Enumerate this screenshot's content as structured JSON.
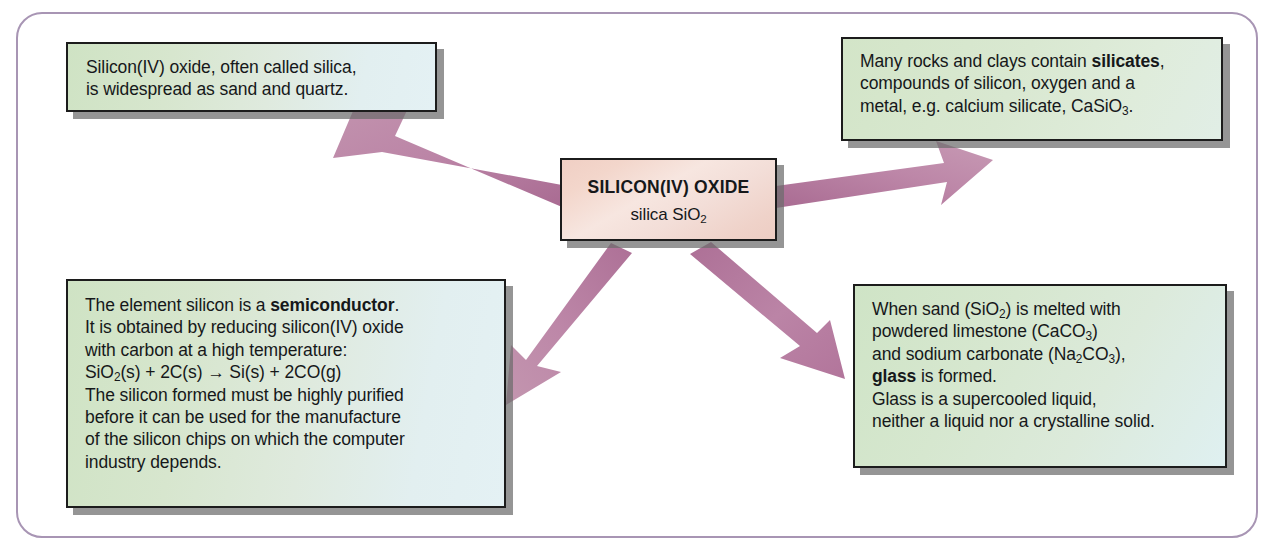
{
  "diagram": {
    "frame_border_color": "#a895b4",
    "arrow_color": "#b5799f",
    "box_border_color": "#1c1c1c",
    "box_shadow_color": "#6c6c6c"
  },
  "center": {
    "title": "SILICON(IV) OXIDE",
    "subtitle_prefix": "silica SiO",
    "subtitle_sub": "2",
    "fill_start": "#f0cfc4",
    "fill_end": "#f7e6e0"
  },
  "boxes": {
    "silica": {
      "name": "silica occurrence",
      "lines": [
        [
          {
            "t": "Silicon(IV) oxide, often called silica,"
          }
        ],
        [
          {
            "t": "is widespread as sand and quartz."
          }
        ]
      ]
    },
    "silicates": {
      "name": "silicates",
      "lines": [
        [
          {
            "t": "Many rocks and clays contain "
          },
          {
            "t": "silicates",
            "b": true
          },
          {
            "t": ","
          }
        ],
        [
          {
            "t": "compounds of silicon, oxygen and a"
          }
        ],
        [
          {
            "t": "metal, e.g. calcium silicate, CaSiO"
          },
          {
            "t": "3",
            "sub": true
          },
          {
            "t": "."
          }
        ]
      ]
    },
    "semiconductor": {
      "name": "silicon semiconductor",
      "lines": [
        [
          {
            "t": "The element silicon is a "
          },
          {
            "t": "semiconductor",
            "b": true
          },
          {
            "t": "."
          }
        ],
        [
          {
            "t": "It is obtained by reducing silicon(IV) oxide"
          }
        ],
        [
          {
            "t": "with carbon at a high temperature:"
          }
        ],
        [
          {
            "t": "SiO"
          },
          {
            "t": "2",
            "sub": true
          },
          {
            "t": "(s)  +  2C(s)  "
          },
          {
            "t": "→",
            "arrow": true
          },
          {
            "t": "  Si(s)  +  2CO(g)"
          }
        ],
        [
          {
            "t": "The silicon formed must be highly purified"
          }
        ],
        [
          {
            "t": "before it can be used for the manufacture"
          }
        ],
        [
          {
            "t": "of the silicon chips on which the computer"
          }
        ],
        [
          {
            "t": "industry depends."
          }
        ]
      ]
    },
    "glass": {
      "name": "glass manufacture",
      "lines": [
        [
          {
            "t": "When sand (SiO"
          },
          {
            "t": "2",
            "sub": true
          },
          {
            "t": ") is melted with"
          }
        ],
        [
          {
            "t": "powdered limestone (CaCO"
          },
          {
            "t": "3",
            "sub": true
          },
          {
            "t": ")"
          }
        ],
        [
          {
            "t": "and sodium carbonate (Na"
          },
          {
            "t": "2",
            "sub": true
          },
          {
            "t": "CO"
          },
          {
            "t": "3",
            "sub": true
          },
          {
            "t": "),"
          }
        ],
        [
          {
            "t": "glass",
            "b": true
          },
          {
            "t": " is formed."
          }
        ],
        [
          {
            "t": "Glass is a supercooled liquid,"
          }
        ],
        [
          {
            "t": "neither a liquid nor a crystalline solid."
          }
        ]
      ]
    }
  },
  "arrows": [
    {
      "name": "arrow-center-to-silica",
      "from": "center",
      "to": "silica"
    },
    {
      "name": "arrow-center-to-silicates",
      "from": "center",
      "to": "silicates"
    },
    {
      "name": "arrow-center-to-semiconductor",
      "from": "center",
      "to": "semiconductor"
    },
    {
      "name": "arrow-center-to-glass",
      "from": "center",
      "to": "glass"
    }
  ]
}
